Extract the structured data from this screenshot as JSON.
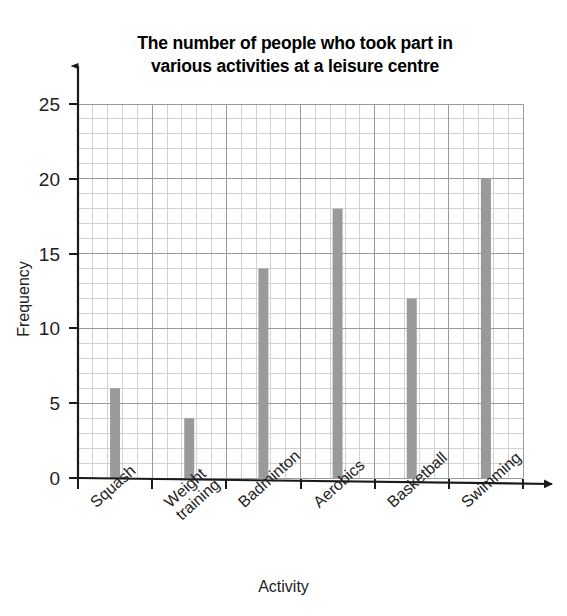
{
  "chart_data": {
    "type": "bar",
    "title": "The number of people who took part in various activities at a leisure centre",
    "title_line1": "The number of people who took part in",
    "title_line2": "various activities at a leisure centre",
    "xlabel": "Activity",
    "ylabel": "Frequency",
    "categories": [
      "Squash",
      "Weight training",
      "Badminton",
      "Aerobics",
      "Basketball",
      "Swimming"
    ],
    "values": [
      6,
      4,
      14,
      18,
      12,
      20
    ],
    "ylim": [
      0,
      25
    ],
    "ytick_labels": [
      "0",
      "5",
      "10",
      "15",
      "20",
      "25"
    ],
    "ytick_values": [
      0,
      5,
      10,
      15,
      20,
      25
    ],
    "y_major_step": 5,
    "y_minor_step": 1,
    "grid": "major and minor gridlines",
    "legend": "none",
    "bar_color": "#9a9a9a",
    "grid_major_color": "#9b9b9b",
    "grid_minor_color": "#d2d2d2",
    "axis_color": "#1a1a1a"
  },
  "xticks": [
    {
      "label": "Squash",
      "line1": "Squash",
      "line2": ""
    },
    {
      "label": "Weight training",
      "line1": "Weight",
      "line2": "training"
    },
    {
      "label": "Badminton",
      "line1": "Badminton",
      "line2": ""
    },
    {
      "label": "Aerobics",
      "line1": "Aerobics",
      "line2": ""
    },
    {
      "label": "Basketball",
      "line1": "Basketball",
      "line2": ""
    },
    {
      "label": "Swimming",
      "line1": "Swimming",
      "line2": ""
    }
  ]
}
